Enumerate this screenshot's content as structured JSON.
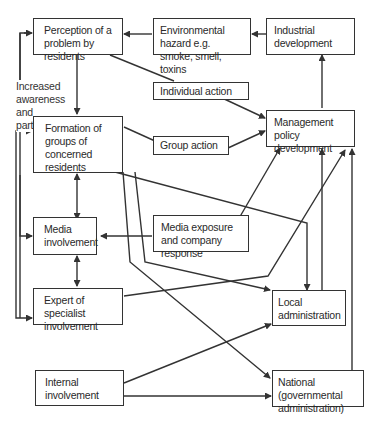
{
  "diagram": {
    "boxes": {
      "perception": "Perception of a problem by residents",
      "environmental": "Environmental hazard e.g. smoke, smell, toxins",
      "industrial": "Industrial development",
      "individual": "Individual action",
      "formation": "Formation of groups of concerned residents",
      "group_action": "Group action",
      "management": "Management policy development",
      "media": "Media involvement",
      "media_exposure": "Media exposure and company response",
      "expert": "Expert of specialist involvement",
      "local": "Local administration",
      "internal": "Internal involvement",
      "national": "National (governmental administration)"
    },
    "side_label": "Increased awareness and participation",
    "colors": {
      "line": "#333333",
      "box_border": "#333333",
      "background": "#ffffff"
    }
  }
}
